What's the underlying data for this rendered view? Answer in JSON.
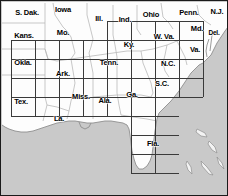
{
  "map": {
    "title": "Southeastern United States state map with quadrangle index grid",
    "colors": {
      "water": "#c9c9c9",
      "land": "#fdfdfd",
      "state_border": "#b4b4b4",
      "coastline": "#8c8c8c",
      "grid_line": "#3a3a3a",
      "frame": "#1a1a1a",
      "label_text": "#000000"
    },
    "frame": {
      "width": 228,
      "height": 196,
      "border_px": 1
    },
    "states": [
      {
        "name": "S. Dak.",
        "x": 26,
        "y": 12,
        "size": "normal"
      },
      {
        "name": "Iowa",
        "x": 62,
        "y": 9,
        "size": "normal"
      },
      {
        "name": "Ill.",
        "x": 98,
        "y": 18,
        "size": "normal"
      },
      {
        "name": "Ind.",
        "x": 124,
        "y": 19,
        "size": "normal"
      },
      {
        "name": "Ohio",
        "x": 150,
        "y": 14,
        "size": "normal"
      },
      {
        "name": "Penn.",
        "x": 188,
        "y": 12,
        "size": "normal"
      },
      {
        "name": "N.J.",
        "x": 216,
        "y": 11,
        "size": "normal"
      },
      {
        "name": "Kans.",
        "x": 23,
        "y": 35,
        "size": "normal"
      },
      {
        "name": "Mo.",
        "x": 62,
        "y": 32,
        "size": "normal"
      },
      {
        "name": "Ky.",
        "x": 128,
        "y": 44,
        "size": "normal"
      },
      {
        "name": "W. Va.",
        "x": 163,
        "y": 36,
        "size": "normal"
      },
      {
        "name": "Md.",
        "x": 196,
        "y": 28,
        "size": "normal"
      },
      {
        "name": "Del.",
        "x": 213,
        "y": 32,
        "size": "normal"
      },
      {
        "name": "Va.",
        "x": 194,
        "y": 49,
        "size": "normal"
      },
      {
        "name": "Okla.",
        "x": 22,
        "y": 62,
        "size": "normal"
      },
      {
        "name": "Ark.",
        "x": 62,
        "y": 73,
        "size": "normal"
      },
      {
        "name": "Tenn.",
        "x": 108,
        "y": 62,
        "size": "normal"
      },
      {
        "name": "N.C.",
        "x": 167,
        "y": 63,
        "size": "normal"
      },
      {
        "name": "S.C.",
        "x": 161,
        "y": 83,
        "size": "normal"
      },
      {
        "name": "Miss.",
        "x": 80,
        "y": 96,
        "size": "normal"
      },
      {
        "name": "Ala.",
        "x": 104,
        "y": 100,
        "size": "normal"
      },
      {
        "name": "Ga.",
        "x": 131,
        "y": 94,
        "size": "normal"
      },
      {
        "name": "Tex.",
        "x": 20,
        "y": 101,
        "size": "normal"
      },
      {
        "name": "La.",
        "x": 58,
        "y": 118,
        "size": "normal"
      },
      {
        "name": "Fla.",
        "x": 152,
        "y": 143,
        "size": "normal"
      }
    ],
    "grid": {
      "description": "Rectangular quadrangle index grid drawn over the states",
      "line_width": 1,
      "cell_width": 24,
      "cell_height": 19,
      "vertical_lines_x": [
        10,
        34,
        58,
        82,
        106,
        130,
        154,
        178,
        202
      ],
      "horizontal_lines_y": [
        39,
        58,
        77,
        96,
        115,
        134,
        153,
        172
      ],
      "segments": [
        {
          "type": "v",
          "x": 10,
          "y1": 39,
          "y2": 115
        },
        {
          "type": "v",
          "x": 34,
          "y1": 39,
          "y2": 115
        },
        {
          "type": "v",
          "x": 58,
          "y1": 39,
          "y2": 115
        },
        {
          "type": "v",
          "x": 82,
          "y1": 39,
          "y2": 115
        },
        {
          "type": "v",
          "x": 106,
          "y1": 20,
          "y2": 115
        },
        {
          "type": "v",
          "x": 130,
          "y1": 20,
          "y2": 172
        },
        {
          "type": "v",
          "x": 154,
          "y1": 20,
          "y2": 172
        },
        {
          "type": "v",
          "x": 178,
          "y1": 20,
          "y2": 96
        },
        {
          "type": "v",
          "x": 202,
          "y1": 20,
          "y2": 96
        },
        {
          "type": "h",
          "y": 20,
          "x1": 106,
          "x2": 202
        },
        {
          "type": "h",
          "y": 39,
          "x1": 10,
          "x2": 202
        },
        {
          "type": "h",
          "y": 58,
          "x1": 10,
          "x2": 202
        },
        {
          "type": "h",
          "y": 77,
          "x1": 10,
          "x2": 202
        },
        {
          "type": "h",
          "y": 96,
          "x1": 10,
          "x2": 202
        },
        {
          "type": "h",
          "y": 115,
          "x1": 10,
          "x2": 178
        },
        {
          "type": "h",
          "y": 134,
          "x1": 130,
          "x2": 178
        },
        {
          "type": "h",
          "y": 153,
          "x1": 130,
          "x2": 178
        },
        {
          "type": "h",
          "y": 172,
          "x1": 130,
          "x2": 178
        }
      ]
    }
  }
}
